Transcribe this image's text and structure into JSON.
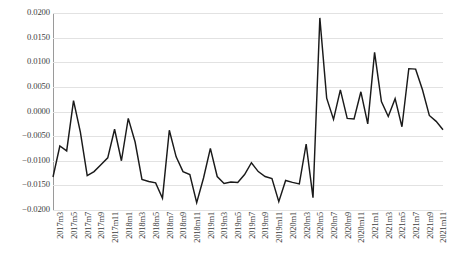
{
  "chart_data": {
    "type": "line",
    "title": "",
    "subtitle": "",
    "xlabel": "",
    "ylabel": "",
    "ylim": [
      -0.02,
      0.02
    ],
    "ytick_step": 0.005,
    "ytick_labels": [
      "0.0200",
      "0.0150",
      "0.0100",
      "0.0050",
      "0.0000",
      "−0.0050",
      "−0.0100",
      "−0.0150",
      "−0.0200"
    ],
    "ytick_values": [
      0.02,
      0.015,
      0.01,
      0.005,
      0.0,
      -0.005,
      -0.01,
      -0.015,
      -0.02
    ],
    "grid": "horizontal",
    "legend": "none",
    "line_color": "#1a1a1a",
    "grid_color": "#e2e2e2",
    "axis_color": "#9a9a9a",
    "xtick_labels": [
      "2017m3",
      "2017m5",
      "2017m7",
      "2017m9",
      "2017m11",
      "2018m1",
      "2018m3",
      "2018m5",
      "2018m7",
      "2018m9",
      "2018m11",
      "2019m1",
      "2019m3",
      "2019m5",
      "2019m7",
      "2019m9",
      "2019m11",
      "2020m1",
      "2020m3",
      "2020m5",
      "2020m7",
      "2020m9",
      "2020m11",
      "2021m1",
      "2021m3",
      "2021m5",
      "2021m7",
      "2021m9",
      "2021m11"
    ],
    "x": [
      "2017m3",
      "2017m4",
      "2017m5",
      "2017m6",
      "2017m7",
      "2017m8",
      "2017m9",
      "2017m10",
      "2017m11",
      "2017m12",
      "2018m1",
      "2018m2",
      "2018m3",
      "2018m4",
      "2018m5",
      "2018m6",
      "2018m7",
      "2018m8",
      "2018m9",
      "2018m10",
      "2018m11",
      "2018m12",
      "2019m1",
      "2019m2",
      "2019m3",
      "2019m4",
      "2019m5",
      "2019m6",
      "2019m7",
      "2019m8",
      "2019m9",
      "2019m10",
      "2019m11",
      "2019m12",
      "2020m1",
      "2020m2",
      "2020m3",
      "2020m4",
      "2020m5",
      "2020m6",
      "2020m7",
      "2020m8",
      "2020m9",
      "2020m10",
      "2020m11",
      "2020m12",
      "2021m1",
      "2021m2",
      "2021m3",
      "2021m4",
      "2021m5",
      "2021m6",
      "2021m7",
      "2021m8",
      "2021m9",
      "2021m10",
      "2021m11",
      "2021m12"
    ],
    "values": [
      -0.0133,
      -0.007,
      -0.008,
      0.0022,
      -0.0042,
      -0.013,
      -0.0122,
      -0.0108,
      -0.0094,
      -0.0036,
      -0.01,
      -0.0014,
      -0.0062,
      -0.0138,
      -0.0142,
      -0.0145,
      -0.0176,
      -0.0038,
      -0.0092,
      -0.0122,
      -0.0128,
      -0.0185,
      -0.0135,
      -0.0075,
      -0.0132,
      -0.0146,
      -0.0143,
      -0.0144,
      -0.0128,
      -0.0104,
      -0.0122,
      -0.0132,
      -0.0136,
      -0.0183,
      -0.014,
      -0.0144,
      -0.0147,
      -0.0066,
      -0.0175,
      0.019,
      0.0027,
      -0.0016,
      0.0044,
      -0.0014,
      -0.0015,
      0.004,
      -0.0025,
      0.012,
      0.002,
      -0.001,
      0.0026,
      -0.0031,
      0.0087,
      0.0086,
      0.0044,
      -0.0008,
      -0.002,
      -0.0037
    ]
  }
}
